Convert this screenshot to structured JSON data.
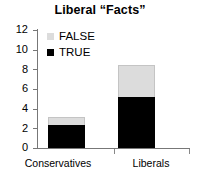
{
  "chart_data": {
    "type": "bar",
    "subtype": "stacked",
    "title": "Liberal “Facts”",
    "xlabel": "",
    "ylabel": "",
    "categories": [
      "Conservatives",
      "Liberals"
    ],
    "series": [
      {
        "name": "TRUE",
        "color": "#000000",
        "values": [
          2.3,
          5.2
        ]
      },
      {
        "name": "FALSE",
        "color": "#dcdcdc",
        "values": [
          0.85,
          3.2
        ]
      }
    ],
    "totals": [
      3.15,
      8.4
    ],
    "ylim": [
      0,
      12
    ],
    "yticks": [
      0,
      2,
      4,
      6,
      8,
      10,
      12
    ],
    "ytick_labels": [
      "0",
      "2",
      "4",
      "6",
      "8",
      "10",
      "12"
    ],
    "grid": false,
    "legend": {
      "position": "top-left-inside",
      "entries": [
        {
          "label": "FALSE",
          "swatch": "light-gray"
        },
        {
          "label": "TRUE",
          "swatch": "black"
        }
      ]
    }
  }
}
